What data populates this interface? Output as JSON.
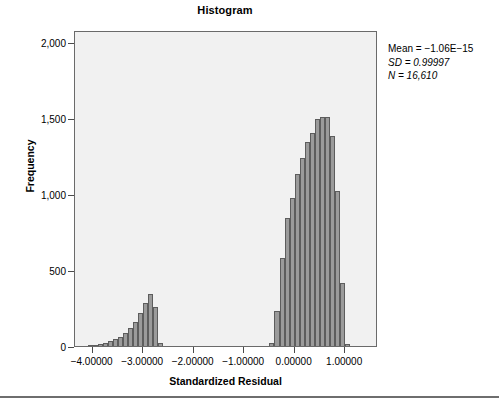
{
  "figure": {
    "title": "Histogram",
    "background_color": "#ffffff",
    "plot_background_color": "#f1f1f1",
    "bar_fill_color": "#9b9b9b",
    "bar_edge_color": "#5d5d5d",
    "axis_color": "#4a4a4a"
  },
  "stats": {
    "mean_label": "Mean = −1.06E−15",
    "sd_label": "SD = 0.99997",
    "n_label": "N = 16,610",
    "mean_value": -1.06e-15,
    "sd_value": 0.99997,
    "n_value": 16610
  },
  "chart_data": {
    "type": "bar",
    "title": "Histogram",
    "subtitle": "",
    "xlabel": "Standardized Residual",
    "ylabel": "Frequency",
    "xlim": [
      -4.35,
      1.65
    ],
    "ylim": [
      0,
      2080
    ],
    "grid": false,
    "legend": "none",
    "annotations": [
      "Mean = −1.06E−15",
      "SD = 0.99997",
      "N = 16,610"
    ],
    "xticks": [
      -4,
      -3,
      -2,
      -1,
      0,
      1
    ],
    "xtick_labels": [
      "−4.00000",
      "−3.00000",
      "−2.00000",
      "−1.00000",
      "0.00000",
      "1.00000"
    ],
    "yticks": [
      0,
      500,
      1000,
      1500,
      2000
    ],
    "ytick_labels": [
      "0",
      "500",
      "1,000",
      "1,500",
      "2,000"
    ],
    "bin_width": 0.1,
    "x": [
      -4.05,
      -3.95,
      -3.85,
      -3.75,
      -3.65,
      -3.55,
      -3.45,
      -3.35,
      -3.25,
      -3.15,
      -3.05,
      -2.95,
      -2.85,
      -2.75,
      -0.45,
      -0.35,
      -0.25,
      -0.15,
      -0.05,
      0.05,
      0.15,
      0.25,
      0.35,
      0.45,
      0.55,
      0.65,
      0.75,
      0.85,
      0.95
    ],
    "values": [
      5,
      8,
      16,
      22,
      30,
      48,
      60,
      88,
      120,
      160,
      215,
      282,
      345,
      258,
      20,
      228,
      580,
      845,
      975,
      1130,
      1240,
      1340,
      1400,
      1495,
      1510,
      1505,
      1380,
      1020,
      415
    ],
    "categories": [
      "−4.05",
      "−3.95",
      "−3.85",
      "−3.75",
      "−3.65",
      "−3.55",
      "−3.45",
      "−3.35",
      "−3.25",
      "−3.15",
      "−3.05",
      "−2.95",
      "−2.85",
      "−2.75",
      "−0.45",
      "−0.35",
      "−0.25",
      "−0.15",
      "−0.05",
      "0.05",
      "0.15",
      "0.25",
      "0.35",
      "0.45",
      "0.55",
      "0.65",
      "0.75",
      "0.85",
      "0.95"
    ],
    "trailing_bins": {
      "x": [
        -2.65,
        1.05
      ],
      "values": [
        18,
        12
      ]
    }
  }
}
